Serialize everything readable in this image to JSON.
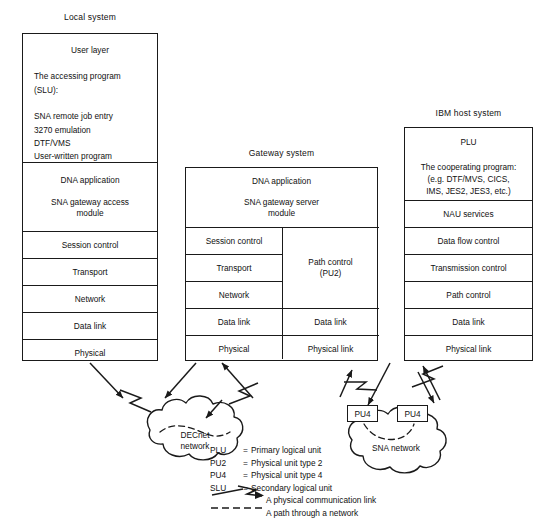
{
  "systems": [
    {
      "key": "local",
      "title": "Local system",
      "top_block": {
        "heading": "User layer",
        "lines": [
          "The accessing program",
          "(SLU):",
          "",
          "SNA remote job entry",
          "3270 emulation",
          "DTF/VMS",
          "User-written program"
        ]
      },
      "app_block": {
        "line1": "DNA application",
        "line2": "SNA gateway access",
        "line3": "module"
      },
      "layers": [
        "Session control",
        "Transport",
        "Network",
        "Data link",
        "Physical"
      ]
    },
    {
      "key": "gateway",
      "title": "Gateway system",
      "app_block": {
        "line1": "DNA application",
        "line2": "SNA gateway server",
        "line3": "module"
      },
      "left_layers": [
        "Session control",
        "Transport",
        "Network",
        "Data link",
        "Physical"
      ],
      "right_layers": [
        "Path control",
        "(PU2)",
        "Data link",
        "Physical link"
      ],
      "right_path_control": {
        "line1": "Path control",
        "line2": "(PU2)"
      },
      "right_data_link": "Data link",
      "right_physical_link": "Physical link"
    },
    {
      "key": "ibm",
      "title": "IBM host system",
      "top_block": {
        "heading": "PLU",
        "lines": [
          "The cooperating program:",
          "(e.g. DTF/MVS, CICS,",
          "IMS, JES2, JES3, etc.)"
        ]
      },
      "layers": [
        "NAU services",
        "Data flow control",
        "Transmission control",
        "Path control",
        "Data link",
        "Physical link"
      ]
    }
  ],
  "clouds": [
    {
      "key": "decnet",
      "line1": "DECnet",
      "line2": "network"
    },
    {
      "key": "sna",
      "line1": "SNA network",
      "line2": ""
    }
  ],
  "nodes": [
    {
      "key": "pu4-left",
      "label": "PU4"
    },
    {
      "key": "pu4-right",
      "label": "PU4"
    }
  ],
  "legend": {
    "abbreviations": [
      {
        "abbr": "PLU",
        "eq": "=",
        "text": "Primary logical unit"
      },
      {
        "abbr": "PU2",
        "eq": "=",
        "text": "Physical unit type 2"
      },
      {
        "abbr": "PU4",
        "eq": "=",
        "text": "Physical unit type 4"
      },
      {
        "abbr": "SLU",
        "eq": "=",
        "text": "Secondary logical unit"
      }
    ],
    "symbols": [
      {
        "key": "physical-link",
        "text": "A physical communication link"
      },
      {
        "key": "network-path",
        "text": "A path through a network"
      }
    ]
  },
  "colors": {
    "ink": "#1a1a1a",
    "background": "#ffffff"
  }
}
